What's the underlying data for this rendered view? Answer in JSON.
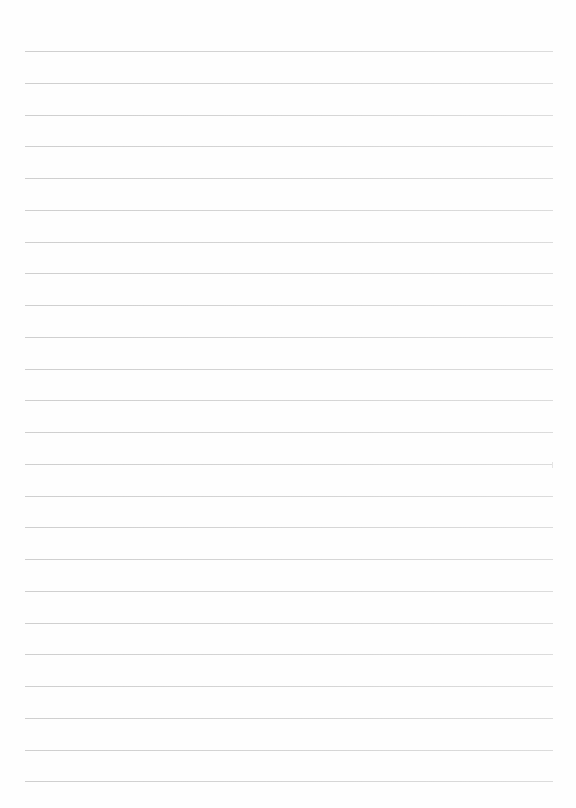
{
  "page": {
    "type": "lined-paper",
    "background": "#fefefe",
    "rule_color": "#d4d4d4",
    "rule_count": 24,
    "first_rule_y": 51,
    "rule_spacing": 31.75,
    "rule_left": 25,
    "rule_width": 528
  }
}
